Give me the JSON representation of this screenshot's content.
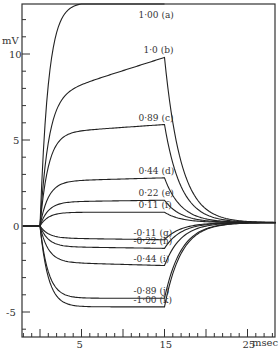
{
  "chart_data": {
    "type": "line",
    "title": "",
    "xlabel": "msec",
    "ylabel": "mV",
    "xlim": [
      -2,
      28.5
    ],
    "ylim": [
      -6.5,
      13
    ],
    "x_ticks": [
      5,
      15,
      25
    ],
    "y_ticks": [
      10,
      5,
      0,
      -5
    ],
    "grid": false,
    "legend": "inline labels",
    "stimulus_on_ms": 0,
    "stimulus_off_ms": 15,
    "series": [
      {
        "name": "1·00 (a)",
        "label": "1·00",
        "tag": "(a)",
        "plateau": 13,
        "end": 13
      },
      {
        "name": "1·0 (b)",
        "label": "1·0",
        "tag": "(b)",
        "plateau": 7.5,
        "end": 9.8
      },
      {
        "name": "0·89 (c)",
        "label": "0·89",
        "tag": "(c)",
        "plateau": 5.4,
        "end": 5.9
      },
      {
        "name": "0·44 (d)",
        "label": "0·44",
        "tag": "(d)",
        "plateau": 2.6,
        "end": 2.8
      },
      {
        "name": "0·22 (e)",
        "label": "0·22",
        "tag": "(e)",
        "plateau": 1.4,
        "end": 1.5
      },
      {
        "name": "0·11 (f)",
        "label": "0·11",
        "tag": "(f)",
        "plateau": 0.8,
        "end": 0.8
      },
      {
        "name": "-0·11 (g)",
        "label": "-0·11",
        "tag": "(g)",
        "plateau": -0.7,
        "end": -0.8
      },
      {
        "name": "-0·22 (h)",
        "label": "-0·22",
        "tag": "(h)",
        "plateau": -1.2,
        "end": -1.3
      },
      {
        "name": "-0·44 (i)",
        "label": "-0·44",
        "tag": "(i)",
        "plateau": -2.1,
        "end": -2.3
      },
      {
        "name": "-0·89 (j)",
        "label": "-0·89",
        "tag": "(j)",
        "plateau": -4.2,
        "end": -4.2
      },
      {
        "name": "-1·00 (k)",
        "label": "-1·00",
        "tag": "(k)",
        "plateau": -4.7,
        "end": -4.7
      }
    ]
  }
}
